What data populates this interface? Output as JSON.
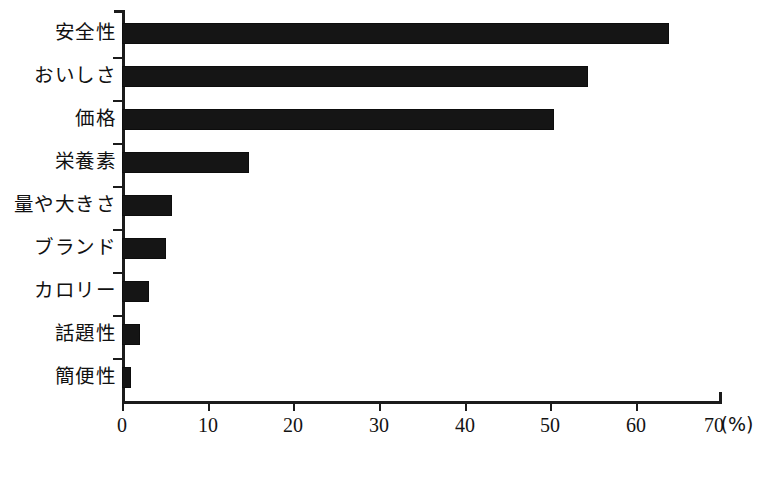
{
  "chart_data": {
    "type": "bar",
    "orientation": "horizontal",
    "title": "",
    "subtitle": "",
    "xlabel": "(%)",
    "ylabel": "",
    "categories": [
      "安全性",
      "おいしさ",
      "価格",
      "栄養素",
      "量や大きさ",
      "ブランド",
      "カロリー",
      "話題性",
      "簡便性"
    ],
    "values": [
      63.8,
      54.4,
      50.4,
      14.8,
      5.8,
      5.1,
      3.2,
      2.1,
      1.1
    ],
    "series": [
      {
        "name": "",
        "values": [
          63.8,
          54.4,
          50.4,
          14.8,
          5.8,
          5.1,
          3.2,
          2.1,
          1.1
        ]
      }
    ],
    "xlim": [
      0,
      70
    ],
    "xticks": [
      0,
      10,
      20,
      30,
      40,
      50,
      60,
      70
    ],
    "xtick_labels": [
      "0",
      "10",
      "20",
      "30",
      "40",
      "50",
      "60",
      "70"
    ],
    "unit_label": "(%)",
    "grid": false,
    "legend": false,
    "legend_position": "none",
    "bar_color": "#151515",
    "axis_color": "#1b1b1b",
    "background_color": "#ffffff"
  }
}
